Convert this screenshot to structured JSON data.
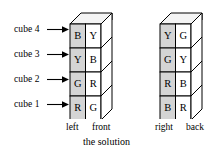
{
  "figure": {
    "caption": "the solution",
    "row_labels": [
      {
        "text": "cube 4",
        "row": 0
      },
      {
        "text": "cube 3",
        "row": 1
      },
      {
        "text": "cube 2",
        "row": 2
      },
      {
        "text": "cube 1",
        "row": 3
      }
    ],
    "face_labels": {
      "left": "left",
      "front": "front",
      "right": "right",
      "back": "back"
    },
    "towers": [
      {
        "name": "left-front-tower",
        "shaded_side": "left",
        "white_side": "front",
        "cubes": [
          {
            "cube": "cube 4",
            "shaded": "B",
            "white": "Y"
          },
          {
            "cube": "cube 3",
            "shaded": "Y",
            "white": "B"
          },
          {
            "cube": "cube 2",
            "shaded": "G",
            "white": "R"
          },
          {
            "cube": "cube 1",
            "shaded": "R",
            "white": "G"
          }
        ]
      },
      {
        "name": "right-back-tower",
        "shaded_side": "right",
        "white_side": "back",
        "cubes": [
          {
            "cube": "cube 4",
            "shaded": "Y",
            "white": "G"
          },
          {
            "cube": "cube 3",
            "shaded": "G",
            "white": "Y"
          },
          {
            "cube": "cube 2",
            "shaded": "R",
            "white": "B"
          },
          {
            "cube": "cube 1",
            "shaded": "B",
            "white": "R"
          }
        ]
      }
    ],
    "colors": {
      "shaded_face": "#d4d4d4",
      "white_face": "#ffffff",
      "top_face": "#f4f4f4",
      "stroke": "#000000",
      "background": "#ffffff"
    }
  }
}
